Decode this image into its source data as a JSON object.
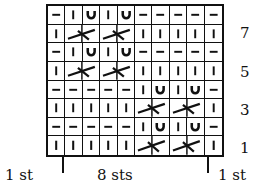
{
  "chart": {
    "title": "",
    "columns": 10,
    "rows": [
      {
        "row": 8,
        "cells": [
          "purl",
          "knit",
          "yo",
          "knit",
          "yo",
          "purl",
          "purl",
          "purl",
          "purl",
          "purl"
        ]
      },
      {
        "row": 7,
        "cells": [
          "knit",
          "cable",
          "cable",
          "cable",
          "cable",
          "knit",
          "knit",
          "knit",
          "knit",
          "knit"
        ]
      },
      {
        "row": 6,
        "cells": [
          "purl",
          "knit",
          "yo",
          "knit",
          "yo",
          "purl",
          "purl",
          "purl",
          "purl",
          "purl"
        ]
      },
      {
        "row": 5,
        "cells": [
          "knit",
          "cable",
          "cable",
          "cable",
          "cable",
          "knit",
          "knit",
          "knit",
          "knit",
          "knit"
        ]
      },
      {
        "row": 4,
        "cells": [
          "purl",
          "purl",
          "purl",
          "purl",
          "purl",
          "knit",
          "yo",
          "knit",
          "yo",
          "purl"
        ]
      },
      {
        "row": 3,
        "cells": [
          "knit",
          "knit",
          "knit",
          "knit",
          "knit",
          "cable",
          "cable",
          "cable",
          "cable",
          "knit"
        ]
      },
      {
        "row": 2,
        "cells": [
          "purl",
          "purl",
          "purl",
          "purl",
          "purl",
          "knit",
          "yo",
          "knit",
          "yo",
          "purl"
        ]
      },
      {
        "row": 1,
        "cells": [
          "knit",
          "knit",
          "knit",
          "knit",
          "knit",
          "cable",
          "cable",
          "cable",
          "cable",
          "knit"
        ]
      }
    ],
    "row_labels": [
      "7",
      "5",
      "3",
      "1"
    ],
    "bottom_labels": {
      "left": "1 st",
      "middle": "8 sts",
      "right": "1 st"
    },
    "symbols": {
      "knit": "|",
      "purl": "–",
      "yo": "∪",
      "cable": "2-st crossing"
    }
  }
}
